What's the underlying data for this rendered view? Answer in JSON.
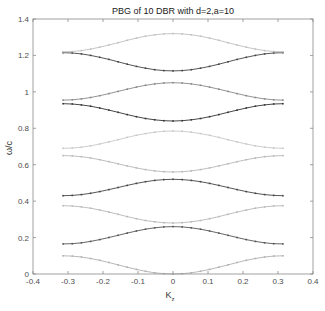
{
  "chart_data": {
    "type": "line",
    "title": "PBG of 10 DBR with d=2,a=10",
    "xlabel": "K",
    "xlabel_subscript": "z",
    "ylabel": "ω/c",
    "xlim": [
      -0.4,
      0.4
    ],
    "ylim": [
      0,
      1.4
    ],
    "xticks": [
      -0.4,
      -0.3,
      -0.2,
      -0.1,
      0,
      0.1,
      0.2,
      0.3,
      0.4
    ],
    "xtick_labels": [
      "-0.4",
      "-0.3",
      "-0.2",
      "-0.1",
      "0",
      "0.1",
      "0.2",
      "0.3",
      "0.4"
    ],
    "yticks": [
      0,
      0.2,
      0.4,
      0.6,
      0.8,
      1.0,
      1.2,
      1.4
    ],
    "ytick_labels": [
      "0",
      "0.2",
      "0.4",
      "0.6",
      "0.8",
      "1",
      "1.2",
      "1.4"
    ],
    "grid": false,
    "legend": null,
    "kz_range": [
      -0.314,
      0.314
    ],
    "series": [
      {
        "name": "band 1",
        "edge": 0.1,
        "center": 0.0,
        "color": "#b0b0b0"
      },
      {
        "name": "band 2",
        "edge": 0.165,
        "center": 0.26,
        "color": "#555555"
      },
      {
        "name": "band 3",
        "edge": 0.375,
        "center": 0.28,
        "color": "#b8b8b8"
      },
      {
        "name": "band 4",
        "edge": 0.43,
        "center": 0.52,
        "color": "#444444"
      },
      {
        "name": "band 5",
        "edge": 0.65,
        "center": 0.56,
        "color": "#b8b8b8"
      },
      {
        "name": "band 6",
        "edge": 0.69,
        "center": 0.785,
        "color": "#c8c8c8"
      },
      {
        "name": "band 7",
        "edge": 0.935,
        "center": 0.84,
        "color": "#333333"
      },
      {
        "name": "band 8",
        "edge": 0.955,
        "center": 1.05,
        "color": "#888888"
      },
      {
        "name": "band 9",
        "edge": 1.215,
        "center": 1.115,
        "color": "#444444"
      },
      {
        "name": "band 10",
        "edge": 1.22,
        "center": 1.32,
        "color": "#c0c0c0"
      }
    ]
  }
}
